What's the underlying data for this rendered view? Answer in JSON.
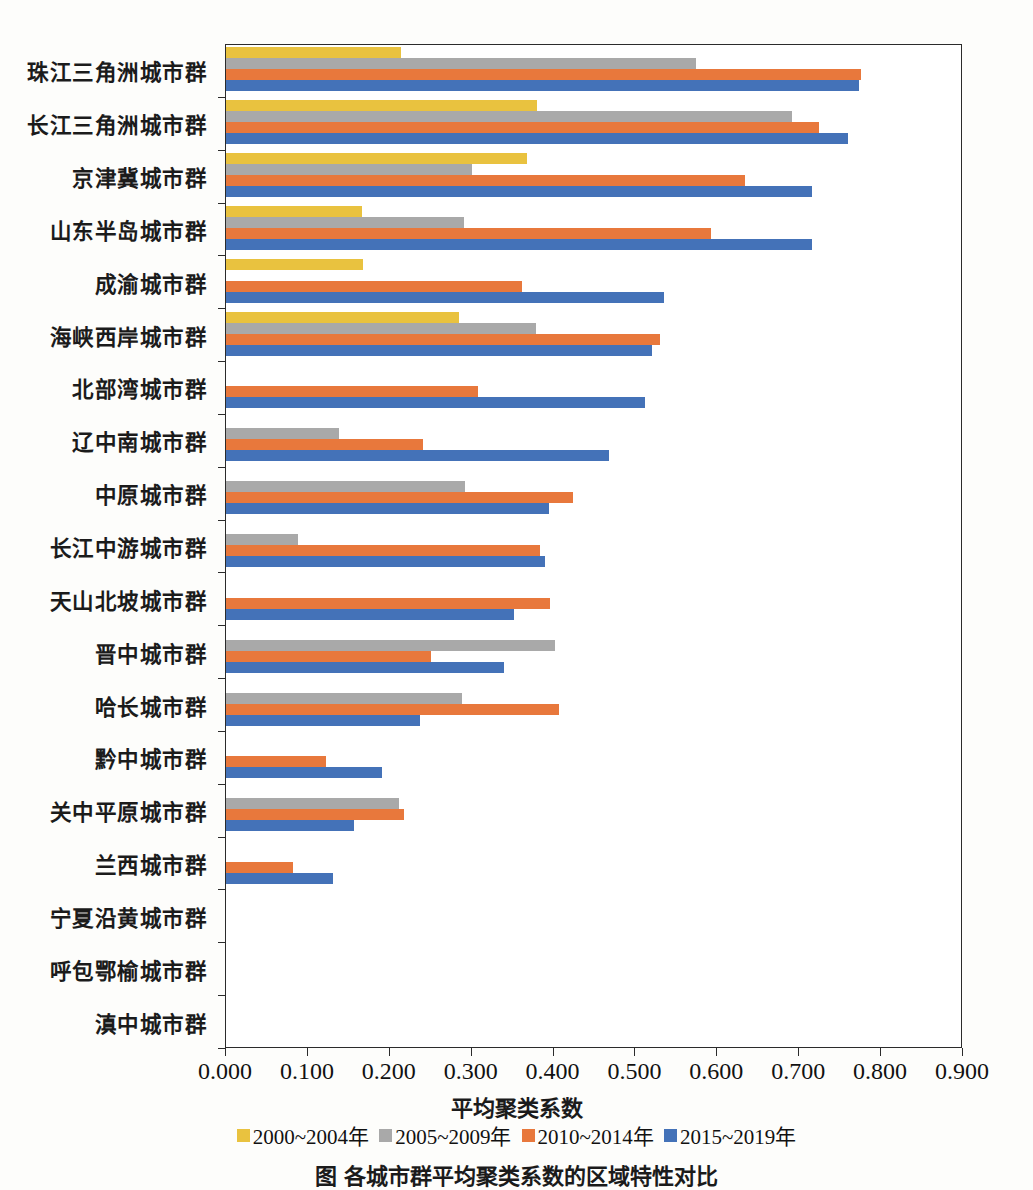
{
  "chart_data": {
    "type": "bar",
    "orientation": "horizontal",
    "title": "",
    "xlabel": "平均聚类系数",
    "ylabel": "",
    "xlim": [
      0.0,
      0.9
    ],
    "xticks": [
      "0.000",
      "0.100",
      "0.200",
      "0.300",
      "0.400",
      "0.500",
      "0.600",
      "0.700",
      "0.800",
      "0.900"
    ],
    "grid": false,
    "legend_position": "bottom",
    "categories": [
      "珠江三角洲城市群",
      "长江三角洲城市群",
      "京津冀城市群",
      "山东半岛城市群",
      "成渝城市群",
      "海峡西岸城市群",
      "北部湾城市群",
      "辽中南城市群",
      "中原城市群",
      "长江中游城市群",
      "天山北坡城市群",
      "晋中城市群",
      "哈长城市群",
      "黔中城市群",
      "关中平原城市群",
      "兰西城市群",
      "宁夏沿黄城市群",
      "呼包鄂榆城市群",
      "滇中城市群"
    ],
    "series": [
      {
        "name": "2000~2004年",
        "color": "#e9c23f",
        "values": [
          0.214,
          0.38,
          0.367,
          0.166,
          0.167,
          0.285,
          0.0,
          0.0,
          0.0,
          0.0,
          0.0,
          0.0,
          0.0,
          0.0,
          0.0,
          0.0,
          0.0,
          0.0,
          0.0
        ]
      },
      {
        "name": "2005~2009年",
        "color": "#a9a9a9",
        "values": [
          0.574,
          0.691,
          0.301,
          0.291,
          0.0,
          0.379,
          0.0,
          0.138,
          0.292,
          0.088,
          0.0,
          0.402,
          0.288,
          0.0,
          0.211,
          0.0,
          0.0,
          0.0,
          0.0
        ]
      },
      {
        "name": "2010~2014年",
        "color": "#e8783c",
        "values": [
          0.775,
          0.724,
          0.634,
          0.592,
          0.361,
          0.53,
          0.308,
          0.24,
          0.424,
          0.383,
          0.396,
          0.25,
          0.407,
          0.122,
          0.217,
          0.082,
          0.0,
          0.0,
          0.0
        ]
      },
      {
        "name": "2015~2019年",
        "color": "#4472b8",
        "values": [
          0.773,
          0.76,
          0.715,
          0.715,
          0.535,
          0.52,
          0.512,
          0.468,
          0.395,
          0.39,
          0.352,
          0.34,
          0.237,
          0.19,
          0.156,
          0.131,
          0.0,
          0.0,
          0.0
        ]
      }
    ]
  },
  "caption": "图    各城市群平均聚类系数的区域特性对比"
}
